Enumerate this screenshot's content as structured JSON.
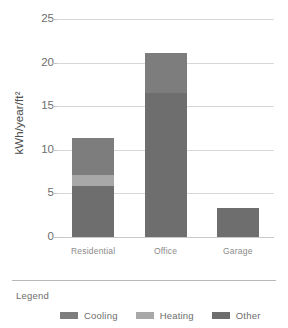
{
  "chart_data": {
    "type": "bar",
    "subtype": "stacked-bar",
    "title": "",
    "xlabel": "",
    "ylabel": "kWh/year/ft²",
    "ylim": [
      0,
      25
    ],
    "yticks": [
      0,
      5,
      10,
      15,
      20,
      25
    ],
    "ytick_labels": [
      "0",
      "5",
      "10",
      "15",
      "20",
      "25"
    ],
    "grid": "horizontal",
    "categories": [
      "Residential",
      "Office",
      "Garage"
    ],
    "series": [
      {
        "name": "Other",
        "color": "#6e6e6e",
        "values": [
          5.9,
          16.5,
          3.3
        ]
      },
      {
        "name": "Heating",
        "color": "#a8a8a8",
        "values": [
          1.2,
          0.0,
          0.0
        ]
      },
      {
        "name": "Cooling",
        "color": "#7d7d7d",
        "values": [
          4.3,
          4.6,
          0.0
        ]
      }
    ],
    "totals": [
      11.4,
      21.1,
      3.3
    ],
    "legend_position": "bottom",
    "legend_title": "Legend"
  },
  "axes": {
    "y_title": "kWh/year/ft²",
    "y_ticks": [
      {
        "value": 25,
        "label": "25"
      },
      {
        "value": 20,
        "label": "20"
      },
      {
        "value": 15,
        "label": "15"
      },
      {
        "value": 10,
        "label": "10"
      },
      {
        "value": 5,
        "label": "5"
      },
      {
        "value": 0,
        "label": "0"
      }
    ],
    "x_ticks": [
      {
        "label": "Residential"
      },
      {
        "label": "Office"
      },
      {
        "label": "Garage"
      }
    ]
  },
  "legend": {
    "title": "Legend",
    "items": [
      {
        "label": "Cooling",
        "color": "#7d7d7d"
      },
      {
        "label": "Heating",
        "color": "#a8a8a8"
      },
      {
        "label": "Other",
        "color": "#6e6e6e"
      }
    ]
  },
  "colors": {
    "background": "#ffffff",
    "gridline": "#d8d8d8",
    "axis_text": "#6d6d6d",
    "legend_text": "#6d6d6d",
    "divider": "#b8b8b8",
    "cooling": "#7d7d7d",
    "heating": "#a8a8a8",
    "other": "#6e6e6e"
  }
}
